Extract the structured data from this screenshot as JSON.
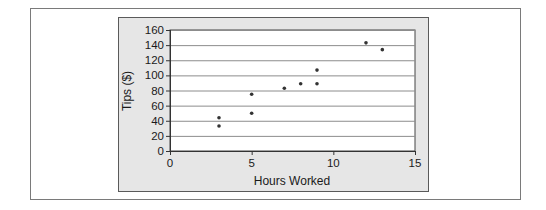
{
  "chart_data": {
    "type": "scatter",
    "title": "",
    "xlabel": "Hours Worked",
    "ylabel": "Tips ($)",
    "xlim": [
      0,
      15
    ],
    "ylim": [
      0,
      160
    ],
    "xticks": [
      0,
      5,
      10,
      15
    ],
    "yticks": [
      0,
      20,
      40,
      60,
      80,
      100,
      120,
      140,
      160
    ],
    "grid": "horizontal",
    "legend": null,
    "series": [
      {
        "name": "Tips vs Hours",
        "points": [
          {
            "x": 3,
            "y": 44
          },
          {
            "x": 3,
            "y": 33
          },
          {
            "x": 5,
            "y": 75
          },
          {
            "x": 5,
            "y": 50
          },
          {
            "x": 7,
            "y": 83
          },
          {
            "x": 8,
            "y": 89
          },
          {
            "x": 9,
            "y": 107
          },
          {
            "x": 9,
            "y": 89
          },
          {
            "x": 12,
            "y": 143
          },
          {
            "x": 13,
            "y": 134
          }
        ]
      }
    ]
  },
  "colors": {
    "panel_background": "#e6e6e6",
    "plot_background": "#ffffff",
    "gridline": "#8c8c8c",
    "marker": "#333333",
    "text": "#1a1a1a"
  }
}
